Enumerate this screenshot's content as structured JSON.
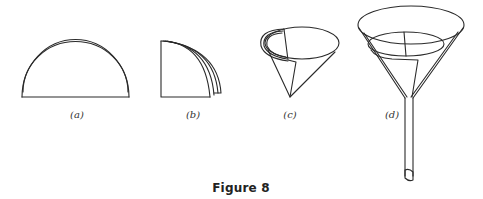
{
  "figure": {
    "caption": "Figure 8",
    "panels": [
      {
        "id": "a",
        "label": "(a)",
        "description": "filter paper folded in half (semicircle)"
      },
      {
        "id": "b",
        "label": "(b)",
        "description": "folded again into a quarter"
      },
      {
        "id": "c",
        "label": "(c)",
        "description": "opened into a cone"
      },
      {
        "id": "d",
        "label": "(d)",
        "description": "cone placed in a funnel"
      }
    ]
  }
}
